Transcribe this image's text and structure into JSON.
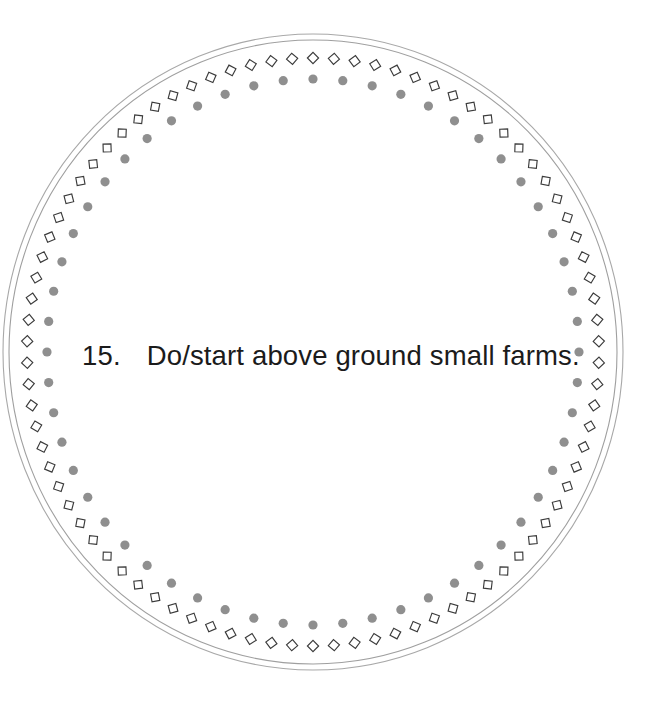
{
  "page": {
    "background_color": "#ffffff",
    "width": 662,
    "height": 709,
    "kind": "decorative-circular-card"
  },
  "caption": {
    "number": "15.",
    "text": "Do/start above ground small farms.",
    "full_text": "15.    Do/start above ground small farms.",
    "color": "#1b1b1b",
    "font_size_px": 27.5
  },
  "ornament": {
    "center_x": 313,
    "center_y": 352,
    "outer_ring": {
      "name": "outer-thin-circle",
      "rx": 310,
      "ry": 318,
      "stroke_color": "#a8a8a8",
      "stroke_width": 1.1
    },
    "second_ring": {
      "name": "second-thin-circle",
      "rx": 304,
      "ry": 312,
      "stroke_color": "#9f9f9f",
      "stroke_width": 1.1
    },
    "diamond_ring": {
      "name": "diamond-chain-ring",
      "rx": 286,
      "ry": 294,
      "count": 86,
      "size": 11.2,
      "stroke_color": "#3b3b3b",
      "stroke_width": 1.15,
      "fill": "none"
    },
    "dot_ring": {
      "name": "gray-dot-ring",
      "rx": 266,
      "ry": 273,
      "count": 56,
      "radius": 4.6,
      "fill_color": "#8f8f8f"
    }
  }
}
